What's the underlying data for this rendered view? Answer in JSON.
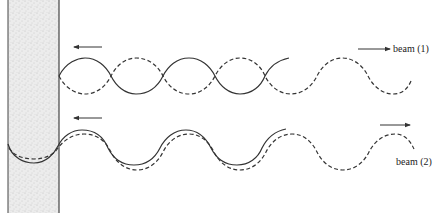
{
  "figure": {
    "wall": {
      "x1": 8,
      "x2": 59,
      "fill_color": "#e6e6e6",
      "edge_color": "#444444"
    },
    "beams": [
      {
        "id": "beam-1",
        "label": "beam (1)",
        "center_y": 76,
        "amplitude": 18,
        "period": 102,
        "incident_arrow_direction": "left",
        "transmitted_arrow_direction": "right",
        "description": "Counter-propagating solid and dashed waves that are mirror images (180° phase), forming nodes; dashed wave continues to the right"
      },
      {
        "id": "beam-2",
        "label": "beam (2)",
        "center_y": 148,
        "amplitude": 18,
        "period": 102,
        "incident_arrow_direction": "left",
        "transmitted_arrow_direction": "right",
        "description": "Solid and dashed waves nearly in phase, slightly offset; solid wave penetrates into the wall"
      }
    ],
    "line_color": "#333333"
  }
}
